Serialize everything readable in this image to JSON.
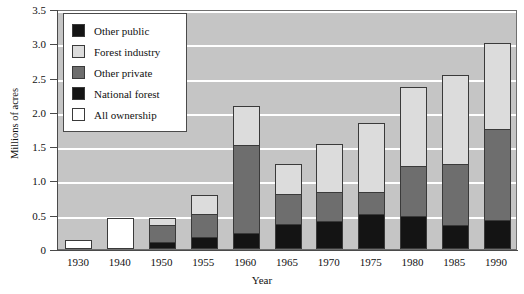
{
  "chart_data": {
    "type": "bar",
    "subtype": "stacked",
    "title": "",
    "xlabel": "Year",
    "ylabel": "Millions of acres",
    "ylim": [
      0,
      3.5
    ],
    "ytick_labels": [
      "0",
      "0.5",
      "1.0",
      "1.5",
      "2.0",
      "2.5",
      "3.0",
      "3.5"
    ],
    "ytick_values": [
      0,
      0.5,
      1.0,
      1.5,
      2.0,
      2.5,
      3.0,
      3.5
    ],
    "grid": "horizontal-white",
    "legend_position": "top-left",
    "categories": [
      "1930",
      "1940",
      "1950",
      "1955",
      "1960",
      "1965",
      "1970",
      "1975",
      "1980",
      "1985",
      "1990"
    ],
    "series": [
      {
        "name": "All ownership",
        "color": "#ffffff",
        "values": [
          0.13,
          0.45,
          0,
          0,
          0,
          0,
          0,
          0,
          0,
          0,
          0
        ]
      },
      {
        "name": "National forest",
        "color": "#141414",
        "values": [
          0,
          0,
          0.1,
          0.18,
          0.23,
          0.36,
          0.41,
          0.51,
          0.48,
          0.35,
          0.42
        ]
      },
      {
        "name": "Other private",
        "color": "#6e6e6e",
        "values": [
          0,
          0,
          0.25,
          0.33,
          1.29,
          0.44,
          0.42,
          0.32,
          0.73,
          0.89,
          1.33
        ]
      },
      {
        "name": "Forest industry",
        "color": "#dcdcdc",
        "values": [
          0,
          0,
          0.1,
          0.28,
          0.56,
          0.44,
          0.7,
          1.01,
          1.16,
          1.3,
          1.25
        ]
      },
      {
        "name": "Other public",
        "color": "#141414",
        "values": [
          0,
          0,
          0,
          0,
          0,
          0,
          0,
          0,
          0,
          0,
          0
        ]
      }
    ],
    "totals": [
      0.13,
      0.45,
      0.45,
      0.79,
      2.08,
      1.24,
      1.53,
      1.84,
      2.37,
      2.53,
      3.0
    ]
  },
  "legend": {
    "items": [
      {
        "label": "Other public",
        "swatch": "swatch-black-icon",
        "color": "#141414"
      },
      {
        "label": "Forest industry",
        "swatch": "swatch-light-gray-icon",
        "color": "#dcdcdc"
      },
      {
        "label": "Other private",
        "swatch": "swatch-mid-gray-icon",
        "color": "#6e6e6e"
      },
      {
        "label": "National forest",
        "swatch": "swatch-black-icon",
        "color": "#141414"
      },
      {
        "label": "All ownership",
        "swatch": "swatch-white-icon",
        "color": "#ffffff"
      }
    ]
  },
  "axes": {
    "y_title": "Millions of acres",
    "x_title": "Year"
  },
  "style": {
    "plot_background": "#c5c5c5",
    "gridline_color": "#ffffff",
    "axis_color": "#4a4a4a",
    "page_background": "#ffffff"
  }
}
